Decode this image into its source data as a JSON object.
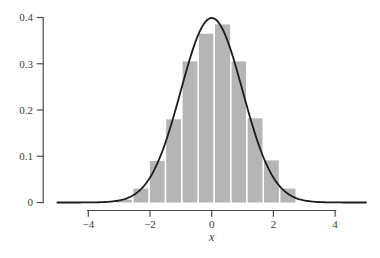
{
  "chart_data": {
    "type": "histogram+line",
    "title": "",
    "xlabel": "x",
    "ylabel": "",
    "xlim": [
      -5,
      5
    ],
    "ylim": [
      0,
      0.4
    ],
    "grid": false,
    "legend": "none",
    "x_ticks": [
      -4,
      -2,
      0,
      2,
      4
    ],
    "x_tick_labels": [
      "−4",
      "−2",
      "0",
      "2",
      "4"
    ],
    "y_ticks": [
      0,
      0.1,
      0.2,
      0.3,
      0.4
    ],
    "y_tick_labels": [
      "0",
      "0.1",
      "0.2",
      "0.3",
      "0.4"
    ],
    "histogram": {
      "bin_edges": [
        -3.09,
        -2.56,
        -2.03,
        -1.5,
        -0.97,
        -0.44,
        0.08,
        0.62,
        1.14,
        1.67,
        2.2,
        2.74
      ],
      "densities": [
        0.006,
        0.03,
        0.09,
        0.18,
        0.305,
        0.365,
        0.385,
        0.305,
        0.182,
        0.091,
        0.03
      ]
    },
    "curve": {
      "kind": "normal_pdf",
      "mean": 0,
      "sd": 1,
      "peak": 0.3989,
      "x_range": [
        -5,
        5
      ]
    },
    "colors": {
      "bar_fill": "#b5b5b5",
      "bar_gap": "#ffffff",
      "curve_stroke": "#1c1c1c",
      "axis_stroke": "#4a4a4a",
      "label_color": "#3a3a3a",
      "background": "#ffffff"
    }
  }
}
